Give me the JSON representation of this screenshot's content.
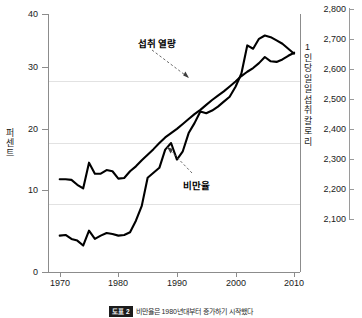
{
  "chart_data": {
    "type": "line",
    "title": "",
    "xlabel": "",
    "xlim": [
      1968,
      2011
    ],
    "x_ticks": [
      "1970",
      "1980",
      "1990",
      "2000",
      "2010"
    ],
    "x_tick_values": [
      1970,
      1980,
      1990,
      2000,
      2010
    ],
    "grid": true,
    "legend": "annotations",
    "axes": [
      {
        "id": "left",
        "label": "퍼센트",
        "ylim": [
          0,
          42
        ],
        "ticks": [
          "0",
          "10",
          "20",
          "30",
          "40"
        ],
        "tick_values": [
          0,
          10,
          20,
          30,
          40
        ]
      },
      {
        "id": "right",
        "label": "1인당 일일 섭취 칼로리",
        "ylim": [
          2060,
          2840
        ],
        "ticks": [
          "2,100",
          "2,200",
          "2,300",
          "2,400",
          "2,500",
          "2,600",
          "2,700",
          "2,800"
        ],
        "tick_values": [
          2100,
          2200,
          2300,
          2400,
          2500,
          2600,
          2700,
          2800
        ]
      }
    ],
    "series": [
      {
        "name": "섭취 열량",
        "axis": "right",
        "units": "kcal/day",
        "color": "#000000",
        "annotation": "섭취 열량",
        "x": [
          1970,
          1971,
          1972,
          1973,
          1974,
          1975,
          1976,
          1977,
          1978,
          1979,
          1980,
          1981,
          1982,
          1983,
          1984,
          1985,
          1986,
          1987,
          1988,
          1989,
          1990,
          1991,
          1992,
          1993,
          1994,
          1995,
          1996,
          1997,
          1998,
          1999,
          2000,
          2001,
          2002,
          2003,
          2004,
          2005,
          2006,
          2007,
          2008,
          2009,
          2010
        ],
        "values": [
          2170,
          2172,
          2160,
          2155,
          2140,
          2185,
          2160,
          2170,
          2178,
          2175,
          2170,
          2172,
          2180,
          2215,
          2260,
          2345,
          2360,
          2375,
          2430,
          2450,
          2400,
          2425,
          2480,
          2510,
          2545,
          2540,
          2548,
          2560,
          2575,
          2590,
          2620,
          2660,
          2745,
          2735,
          2765,
          2775,
          2770,
          2760,
          2750,
          2735,
          2720
        ]
      },
      {
        "name": "비만율",
        "axis": "left",
        "units": "%",
        "color": "#000000",
        "annotation": "비만율",
        "x": [
          1970,
          1971,
          1972,
          1973,
          1974,
          1975,
          1976,
          1977,
          1978,
          1979,
          1980,
          1981,
          1982,
          1983,
          1984,
          1985,
          1986,
          1987,
          1988,
          1989,
          1990,
          1991,
          1992,
          1993,
          1994,
          1995,
          1996,
          1997,
          1998,
          1999,
          2000,
          2001,
          2002,
          2003,
          2004,
          2005,
          2006,
          2007,
          2008,
          2009,
          2010
        ],
        "values": [
          15.1,
          15.1,
          15.0,
          14.2,
          13.6,
          17.8,
          16.0,
          16.0,
          16.6,
          16.4,
          15.2,
          15.3,
          16.4,
          17.2,
          18.2,
          19.1,
          20.0,
          21.0,
          21.9,
          22.6,
          23.3,
          24.1,
          24.9,
          25.7,
          26.4,
          27.2,
          28.0,
          28.7,
          29.4,
          30.2,
          31.0,
          31.9,
          32.6,
          33.2,
          34.0,
          35.0,
          34.3,
          34.2,
          34.6,
          35.2,
          35.7
        ]
      }
    ]
  },
  "axis_left": {
    "title": "퍼센트",
    "ticks": [
      {
        "label": "40",
        "value": 40
      },
      {
        "label": "30",
        "value": 30
      },
      {
        "label": "20",
        "value": 20
      },
      {
        "label": "10",
        "value": 10
      },
      {
        "label": "0",
        "value": 0
      }
    ]
  },
  "axis_right": {
    "title": "1인당 일일 섭취 칼로리",
    "ticks": [
      {
        "label": "2,800",
        "value": 2800
      },
      {
        "label": "2,700",
        "value": 2700
      },
      {
        "label": "2,600",
        "value": 2600
      },
      {
        "label": "2,500",
        "value": 2500
      },
      {
        "label": "2,400",
        "value": 2400
      },
      {
        "label": "2,300",
        "value": 2300
      },
      {
        "label": "2,200",
        "value": 2200
      },
      {
        "label": "2,100",
        "value": 2100
      }
    ]
  },
  "axis_x": {
    "ticks": [
      {
        "label": "1970",
        "value": 1970
      },
      {
        "label": "1980",
        "value": 1980
      },
      {
        "label": "1990",
        "value": 1990
      },
      {
        "label": "2000",
        "value": 2000
      },
      {
        "label": "2010",
        "value": 2010
      }
    ]
  },
  "annotations": {
    "calorie": "섭취 열량",
    "obesity": "비만율"
  },
  "caption": {
    "badge": "도표 2",
    "text": "비만율은 1980년대부터 증가하기 시작했다"
  },
  "colors": {
    "line": "#000000",
    "axis": "#8c8c8c",
    "grid": "#e2e2e2",
    "text": "#1a1a1a"
  }
}
